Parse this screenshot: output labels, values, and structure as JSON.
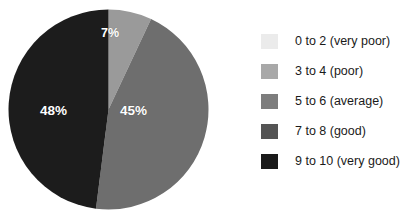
{
  "chart_data": {
    "type": "pie",
    "title": "",
    "xlabel": "",
    "ylabel": "",
    "grid": false,
    "legend_position": "right",
    "start_angle_deg": 0,
    "direction": "clockwise",
    "categories": [
      "0 to 2 (very poor)",
      "3 to 4 (poor)",
      "5 to 6 (average)",
      "7 to 8 (good)",
      "9 to 10 (very good)"
    ],
    "values": [
      0,
      0,
      7,
      45,
      48
    ],
    "colors": [
      "#ebebeb",
      "#a8a8a8",
      "#7d7d7d",
      "#545454",
      "#1a1a1a"
    ],
    "slices": [
      {
        "label": "5 to 6 (average)",
        "value": 7,
        "display": "7%",
        "color": "#9a9a9a"
      },
      {
        "label": "7 to 8 (good)",
        "value": 45,
        "display": "45%",
        "color": "#6e6e6e"
      },
      {
        "label": "9 to 10 (very good)",
        "value": 48,
        "display": "48%",
        "color": "#1c1c1c"
      }
    ],
    "data_labels": [
      "7%",
      "45%",
      "48%"
    ],
    "units": "percent"
  },
  "legend": {
    "items": [
      {
        "label": "0 to 2 (very poor)",
        "color": "#ebebeb"
      },
      {
        "label": "3 to 4 (poor)",
        "color": "#a8a8a8"
      },
      {
        "label": "5 to 6 (average)",
        "color": "#7d7d7d"
      },
      {
        "label": "7 to 8 (good)",
        "color": "#545454"
      },
      {
        "label": "9 to 10 (very good)",
        "color": "#1a1a1a"
      }
    ]
  }
}
